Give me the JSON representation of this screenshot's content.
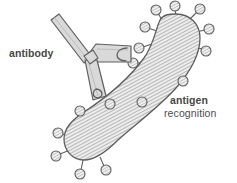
{
  "figure": {
    "background_color": "#ffffff",
    "labels": {
      "antibody": "antibody",
      "antigen": "antigen",
      "recognition": "recognition"
    },
    "colors": {
      "outline": "#595959",
      "antibody_fill": "#d9d9d9",
      "antigen_fill": "#e8e8e8",
      "hatch_line": "#7a7a7a",
      "knob_fill": "#e3e3e3",
      "text": "#474747"
    },
    "antibody": {
      "shape_name": "y-shaped-immunoglobulin",
      "arm_count": 3,
      "binding_site_count": 2,
      "arms": [
        {
          "name": "upper-left-arm",
          "has_binding_cleft": false
        },
        {
          "name": "upper-right-arm",
          "has_binding_cleft": true
        },
        {
          "name": "lower-stem-arm",
          "has_binding_cleft": true
        }
      ]
    },
    "antigen": {
      "shape_name": "curved-club-shaped-antigen",
      "fill_pattern": "diagonal-hatch",
      "epitope_count": 16,
      "epitope_name": "knob-on-stalk-epitope"
    }
  }
}
